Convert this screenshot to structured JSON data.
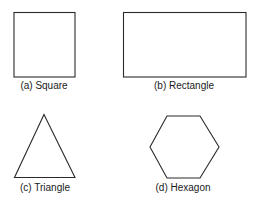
{
  "figure": {
    "shapes": [
      {
        "id": "a",
        "name": "square",
        "label": "(a) Square"
      },
      {
        "id": "b",
        "name": "rectangle",
        "label": "(b) Rectangle"
      },
      {
        "id": "c",
        "name": "triangle",
        "label": "(c) Triangle"
      },
      {
        "id": "d",
        "name": "hexagon",
        "label": "(d) Hexagon"
      }
    ],
    "stroke_color": "#2a2a2a",
    "background": "#ffffff"
  }
}
